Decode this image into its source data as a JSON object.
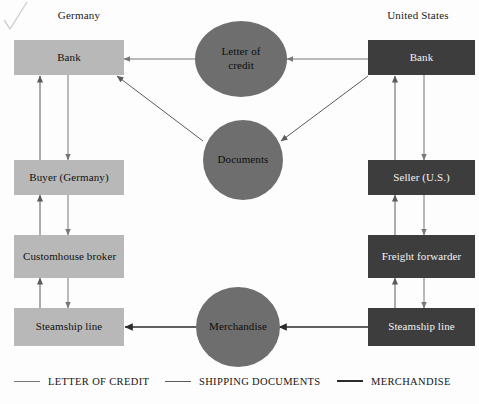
{
  "diagram": {
    "colors": {
      "germany_box_fill": "#b8b8b8",
      "germany_box_text": "#111111",
      "us_box_fill": "#3d3d3d",
      "us_box_text": "#f2f2f2",
      "circle_fill": "#6e6e6e",
      "circle_text": "#0d0d0d",
      "background": "#fdfdfd",
      "arrow_letter_of_credit": "#777777",
      "arrow_shipping_documents": "#5a5a5a",
      "arrow_merchandise": "#2b2b2b"
    },
    "regions": [
      {
        "id": "germany",
        "label": "Germany"
      },
      {
        "id": "united-states",
        "label": "United States"
      }
    ],
    "germany_nodes": [
      {
        "id": "bank",
        "label": "Bank",
        "align": "center"
      },
      {
        "id": "buyer",
        "label": "Buyer (Germany)",
        "align": "center"
      },
      {
        "id": "customhouse-broker",
        "label": "Customhouse broker",
        "align": "left"
      },
      {
        "id": "steamship-line",
        "label": "Steamship line",
        "align": "center"
      }
    ],
    "us_nodes": [
      {
        "id": "bank",
        "label": "Bank",
        "align": "center"
      },
      {
        "id": "seller",
        "label": "Seller (U.S.)",
        "align": "center"
      },
      {
        "id": "freight-forwarder",
        "label": "Freight forwarder",
        "align": "center"
      },
      {
        "id": "steamship-line",
        "label": "Steamship line",
        "align": "center"
      }
    ],
    "center_nodes": [
      {
        "id": "letter-of-credit",
        "label": "Letter of credit"
      },
      {
        "id": "documents",
        "label": "Documents"
      },
      {
        "id": "merchandise",
        "label": "Merchandise"
      }
    ],
    "legend": [
      {
        "id": "letter-of-credit",
        "label": "LETTER OF CREDIT",
        "style": "thin"
      },
      {
        "id": "shipping-documents",
        "label": "SHIPPING DOCUMENTS",
        "style": "med"
      },
      {
        "id": "merchandise",
        "label": "MERCHANDISE",
        "style": "thick"
      }
    ]
  }
}
